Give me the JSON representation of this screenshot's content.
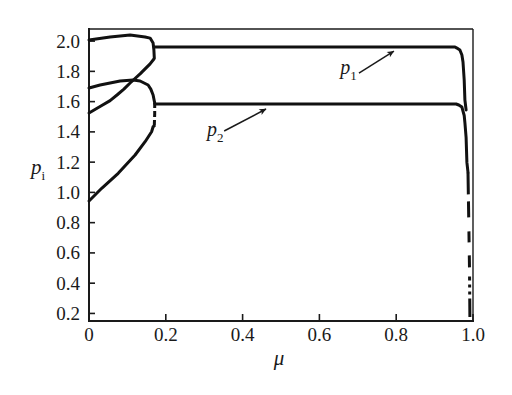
{
  "chart_data": {
    "type": "line",
    "title": "",
    "xlabel": "μ",
    "ylabel": "p_i",
    "xlim": [
      0,
      1.0
    ],
    "ylim": [
      0.15,
      2.08
    ],
    "grid": false,
    "legend": null,
    "xticks": [
      0,
      0.2,
      0.4,
      0.6,
      0.8,
      1.0
    ],
    "xtick_labels": [
      "0",
      "0.2",
      "0.4",
      "0.6",
      "0.8",
      "1.0"
    ],
    "yticks": [
      0.2,
      0.4,
      0.6,
      0.8,
      1.0,
      1.2,
      1.4,
      1.6,
      1.8,
      2.0
    ],
    "ytick_labels": [
      "0.2",
      "0.4",
      "0.6",
      "0.8",
      "1.0",
      "1.2",
      "1.4",
      "1.6",
      "1.8",
      "2.0"
    ],
    "colors": {
      "curve": "#111111",
      "axis": "#1a1a1a",
      "text": "#1a1a1a",
      "background": "#ffffff"
    },
    "series": [
      {
        "id": "branch-upper-from-2-0",
        "name": "branch starting at 2.0",
        "style": "solid",
        "points": [
          [
            0,
            2.007
          ],
          [
            0.055,
            2.027
          ],
          [
            0.107,
            2.04
          ],
          [
            0.146,
            2.027
          ],
          [
            0.159,
            2.02
          ],
          [
            0.167,
            1.987
          ],
          [
            0.169,
            1.941
          ],
          [
            0.17,
            1.888
          ]
        ]
      },
      {
        "id": "branch-rising-from-1-52",
        "name": "branch starting at 1.52",
        "style": "solid",
        "points": [
          [
            0,
            1.525
          ],
          [
            0.031,
            1.571
          ],
          [
            0.055,
            1.607
          ],
          [
            0.073,
            1.644
          ],
          [
            0.091,
            1.683
          ],
          [
            0.107,
            1.723
          ],
          [
            0.133,
            1.783
          ],
          [
            0.159,
            1.849
          ],
          [
            0.169,
            1.882
          ]
        ]
      },
      {
        "id": "branch-hump-from-1-69",
        "name": "branch starting at 1.69",
        "style": "solid",
        "points": [
          [
            0,
            1.69
          ],
          [
            0.029,
            1.71
          ],
          [
            0.055,
            1.723
          ],
          [
            0.081,
            1.736
          ],
          [
            0.115,
            1.743
          ],
          [
            0.133,
            1.736
          ],
          [
            0.154,
            1.71
          ],
          [
            0.161,
            1.683
          ],
          [
            0.167,
            1.644
          ],
          [
            0.171,
            1.591
          ]
        ]
      },
      {
        "id": "junction-at-mu-0-17",
        "name": "merge segment",
        "style": "dashed-short",
        "points": [
          [
            0.171,
            1.591
          ],
          [
            0.171,
            1.52
          ],
          [
            0.17,
            1.44
          ]
        ]
      },
      {
        "id": "branch-rising-from-0-95",
        "name": "branch starting at 0.95",
        "style": "solid",
        "points": [
          [
            0,
            0.943
          ],
          [
            0.033,
            1.027
          ],
          [
            0.076,
            1.126
          ],
          [
            0.12,
            1.247
          ],
          [
            0.146,
            1.335
          ],
          [
            0.163,
            1.401
          ],
          [
            0.167,
            1.434
          ],
          [
            0.17,
            1.44
          ]
        ]
      },
      {
        "id": "p1",
        "name": "p1",
        "style": "solid",
        "points": [
          [
            0.17,
            1.961
          ],
          [
            0.953,
            1.961
          ],
          [
            0.958,
            1.954
          ],
          [
            0.966,
            1.941
          ],
          [
            0.971,
            1.908
          ],
          [
            0.974,
            1.862
          ],
          [
            0.977,
            1.743
          ],
          [
            0.979,
            1.611
          ],
          [
            0.982,
            1.545
          ]
        ]
      },
      {
        "id": "p2",
        "name": "p2",
        "style": "solid",
        "points": [
          [
            0.172,
            1.584
          ],
          [
            0.956,
            1.584
          ],
          [
            0.963,
            1.578
          ],
          [
            0.971,
            1.564
          ],
          [
            0.977,
            1.508
          ],
          [
            0.979,
            1.461
          ],
          [
            0.982,
            1.363
          ],
          [
            0.984,
            1.198
          ],
          [
            0.987,
            1.132
          ]
        ]
      },
      {
        "id": "collapse-near-mu-1",
        "name": "collapse near μ = 1",
        "style": "dashed",
        "points": [
          [
            0.987,
            1.132
          ],
          [
            0.989,
            0.8
          ],
          [
            0.991,
            0.5
          ],
          [
            0.992,
            0.176
          ]
        ]
      }
    ],
    "annotations": [
      {
        "id": "p1",
        "text": "p_1",
        "xytext": [
          0.654,
          1.783
        ],
        "arrow_from": [
          0.703,
          1.789
        ],
        "xy": [
          0.794,
          1.934
        ]
      },
      {
        "id": "p2",
        "text": "p_2",
        "xytext": [
          0.307,
          1.373
        ],
        "arrow_from": [
          0.352,
          1.406
        ],
        "xy": [
          0.461,
          1.551
        ]
      }
    ]
  }
}
